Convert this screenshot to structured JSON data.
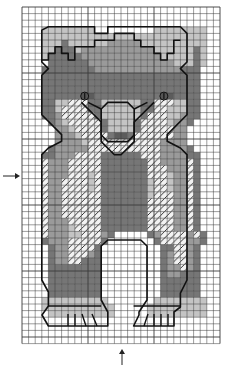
{
  "pattern": {
    "title": "Bear cross-stitch chart",
    "columns": 30,
    "rows": 51,
    "origin": {
      "x": 22,
      "y": 7
    },
    "cell_size": 6.6,
    "colors": {
      "grid": "#3a3a3a",
      "background": "#ffffff",
      "outline": "#111111",
      "shade_light": "#c4c4c4",
      "shade_mid": "#9a9a9a",
      "shade_dark": "#767676",
      "shade_darker": "#5c5c5c",
      "hatch": "#222222"
    },
    "legend_shades": [
      "light",
      "mid",
      "dark",
      "darker",
      "hatched"
    ],
    "center_markers": {
      "left_arrow": {
        "label": "center row marker",
        "y": 176
      },
      "bottom_arrow": {
        "label": "center column marker",
        "x": 122
      }
    },
    "features": [
      "ears",
      "head",
      "eyes",
      "muzzle",
      "nose",
      "chest",
      "front legs",
      "paws with claws"
    ],
    "map": [
      "..............................",
      "..............................",
      "..............................",
      "...LLLLLLLL.........LLLLLLLL..",
      "...LLLLLLLLLLLLLLLLLLLLLLLLL..",
      "...LLLDLLLLLLMMMMMLLLLLLLLLL..",
      "...LLDDDLMMMMMMMMMMMLLLLLLDL..",
      "...LDDDDDMMMMMMMMMMMMLLLLLDL..",
      "....DDDDDDMMMMMMMMMMMMMLLLDL..",
      "...DDDDDDDDMMMMMMMMMMMMMDDD...",
      "...DDDDDDDDDDDDDDDDDDDDDDDD...",
      "...DDDDDDDDDDDDDDDDDDDDDDDD...",
      "...DDDDDDDDDDDDDDDDDDDDDDDD...",
      "...DDDDDDXXDDDDDDDDDDXXDDDD...",
      "...DDLLHHHDDLLLLLLDDHHHLLDD...",
      "...DDLHHHHDDLLLLLLDDHHLLLDD...",
      "...DDMHHHHHDLLLLLLDHHHLLMDD...",
      "....DMLHHHHHDLLLLDHHHHLMMD....",
      ".....MMLHHHHDLLLLDHHHHHMM.....",
      ".....MMMLHHHHDXXDHHHHHHMM.....",
      ".....MMMMLHHHHHHHHHHHMMMM.....",
      "....DMMMMMHHHHHHHHHHHMMMMD....",
      "...DDMMMHHHHDDDDDDHHHMMMMDD...",
      "...HMMMHHHHHDDDDDDDHHMMMMHD...",
      "...HMMMHHHHHDDDDDDDHHHMMMHD...",
      "...HMMMHHHLHDDDDDDDHHHLMMHD...",
      "...HMMHHHHLHDDDDDDDLHHLMMHD...",
      "...HMMHHHHLHDDDDDDDLHHLMMHD...",
      "...HMMHHHHHHDDDDDDDLHHHMMHD...",
      "...HMMHHHHHHDDDDDDDHHHHMMHD...",
      "...HMMHHHHHHDDDDDDDHHHHMMHD...",
      "...HMMHHHHHHDDDDDDDHHHHMMHD...",
      "...HMMMHHHHHDDDDDDDHHHHMMHD...",
      "...HMMMLHHHHDDDDDDDHHHHMMHD...",
      "...HMMMLLHHHMD.....DMHHHHMHD..",
      "...DMMMHHHHHD.......DHHHHMMD..",
      "....DMMHHHHD.........DDHHMD...",
      "....DMMHHHMD.........DMHHMD...",
      "....DMMHHDDD.........DMHHMD...",
      "....DDDDDDDD.........DMMHMD...",
      "....DDDDDDDD.........DMMDDD...",
      "....DDDDDDDD.........DDDDDD...",
      "....DDDDDDDD.........DDDDDD...",
      "....DDDDDDDD.........DDDDDD...",
      "...LLLLLLLLLL.......LLLLLLLL..",
      "...LLLLLLLLLLL.....LLLLLLLLL..",
      "....LLLLLLLLLL.....LLLLLLLLL..",
      "..............................",
      "..............................",
      "..............................",
      ".............................."
    ],
    "eyes": [
      {
        "col": 9,
        "row": 13
      },
      {
        "col": 21,
        "row": 13
      }
    ]
  }
}
